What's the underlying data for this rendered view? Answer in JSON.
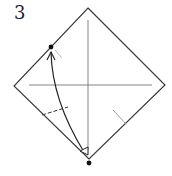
{
  "diagram": {
    "step_number": "3",
    "colors": {
      "line": "#333333",
      "crease": "#555555",
      "dot": "#111111",
      "background": "#ffffff"
    },
    "elements": {
      "paper": "square-diamond",
      "creases": [
        "vertical-center-crease",
        "horizontal-center-crease"
      ],
      "fold_line": "dashed-valley-fold-lower-left",
      "reference_mark": "short-pinch-mark-lower-right",
      "arrow": "curved-fold-arrow-bottom-to-upper-left",
      "points": [
        "target-point-upper-left-edge",
        "source-point-bottom-corner"
      ]
    }
  }
}
